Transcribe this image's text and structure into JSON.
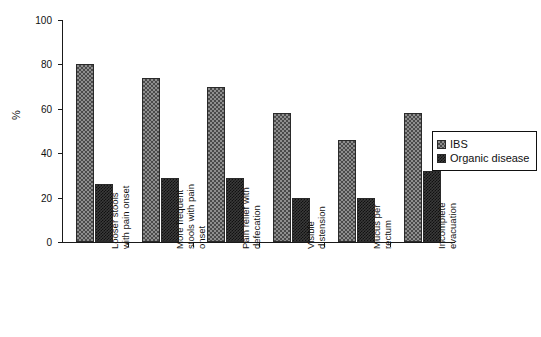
{
  "chart_data": {
    "type": "bar",
    "title": "",
    "xlabel": "",
    "ylabel": "%",
    "ylim": [
      0,
      100
    ],
    "ytick_labels": [
      "0",
      "20",
      "40",
      "60",
      "80",
      "100"
    ],
    "ytick_values": [
      0,
      20,
      40,
      60,
      80,
      100
    ],
    "grid": false,
    "legend_position": "center-right",
    "categories": [
      "Looser stools\nwith pain onset",
      "More frequent\nstools with pain\nonset",
      "Pain relief with\ndefecation",
      "Visible\ndistension",
      "Mucus per\nrectum",
      "Incomplete\nevacuation"
    ],
    "series": [
      {
        "name": "IBS",
        "values": [
          80,
          74,
          70,
          58,
          46,
          58
        ],
        "color": "#8e8e8e"
      },
      {
        "name": "Organic disease",
        "values": [
          26,
          29,
          29,
          20,
          20,
          32
        ],
        "color": "#3a3a3a"
      }
    ]
  },
  "legend": {
    "items": [
      {
        "label": "IBS"
      },
      {
        "label": "Organic disease"
      }
    ]
  }
}
